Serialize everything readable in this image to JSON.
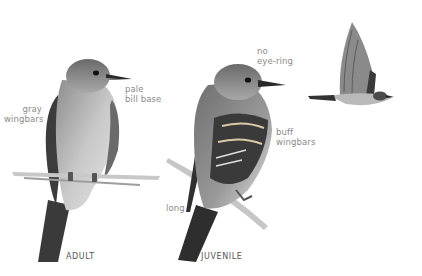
{
  "figure": {
    "birds": [
      {
        "id": "adult",
        "caption": "ADULT",
        "annotations": [
          {
            "line1": "gray",
            "line2": "wingbars"
          },
          {
            "line1": "pale",
            "line2": "bill base"
          }
        ]
      },
      {
        "id": "juvenile",
        "caption": "JUVENILE",
        "annotations": [
          {
            "line1": "no",
            "line2": "eye-ring"
          },
          {
            "line1": "buff",
            "line2": "wingbars"
          },
          {
            "line1": "long",
            "line2": ""
          }
        ]
      },
      {
        "id": "flying",
        "caption": "",
        "annotations": []
      }
    ]
  },
  "colors": {
    "background": "#ffffff",
    "label_text": "#8a8a8a",
    "caption_text": "#555555",
    "bird_dark": "#2e2e2e",
    "bird_mid": "#7d7d7d",
    "bird_light": "#d9d9d9",
    "branch": "#bdbdbd"
  }
}
